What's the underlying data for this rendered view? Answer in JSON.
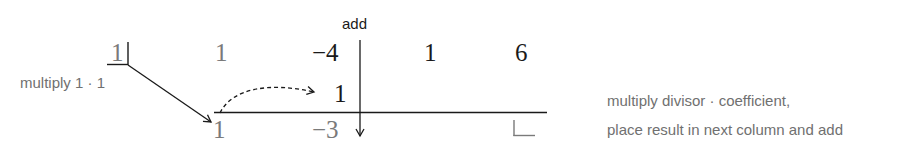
{
  "diagram": {
    "type": "synthetic-division",
    "divisor": "1",
    "top_row": [
      "1",
      "−4",
      "1",
      "6"
    ],
    "middle_row": [
      "",
      "1",
      "",
      ""
    ],
    "bottom_row": [
      "1",
      "−3",
      "",
      ""
    ],
    "labels": {
      "add": "add",
      "multiply_step": "multiply 1 · 1",
      "explanation_line1": "multiply divisor · coefficient,",
      "explanation_line2": "place result in next column and add"
    },
    "colors": {
      "ink": "#1a1a1a",
      "faded": "#7a7a7a",
      "note": "#707070"
    }
  }
}
